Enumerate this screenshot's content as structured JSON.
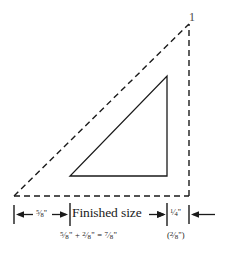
{
  "figure": {
    "type": "quilting-seam-allowance-diagram",
    "background_color": "#ffffff",
    "line_color": "#1a1a1a"
  },
  "shapes": {
    "cut_triangle": {
      "name": "cut-size-triangle",
      "style": "dashed",
      "vertices": [
        [
          14,
          196
        ],
        [
          189,
          196
        ],
        [
          189,
          24
        ]
      ]
    },
    "finished_triangle": {
      "name": "finished-size-triangle",
      "style": "solid",
      "vertices": [
        [
          70,
          176
        ],
        [
          167,
          176
        ],
        [
          167,
          76
        ]
      ]
    }
  },
  "dimensions": {
    "left_seam": {
      "label": "5/8\"",
      "numerator": "5",
      "denominator": "8",
      "unit": "\"",
      "from_x": 14,
      "to_x": 70
    },
    "finished_size": {
      "label": "Finished size",
      "from_x": 70,
      "to_x": 167
    },
    "right_seam": {
      "label": "1/4\"",
      "numerator": "1",
      "denominator": "4",
      "unit": "\"",
      "alt_label": "(2/8\")",
      "alt_numerator": "2",
      "alt_denominator": "8",
      "from_x": 167,
      "to_x": 189
    }
  },
  "equation": {
    "text": "5/8\" + 2/8\" = 7/8\"",
    "terms": [
      {
        "numerator": "5",
        "denominator": "8",
        "unit": "\""
      },
      {
        "numerator": "2",
        "denominator": "8",
        "unit": "\""
      },
      {
        "numerator": "7",
        "denominator": "8",
        "unit": "\""
      }
    ],
    "plus": "+",
    "equals": "="
  },
  "apex_mark": {
    "label": "1"
  }
}
